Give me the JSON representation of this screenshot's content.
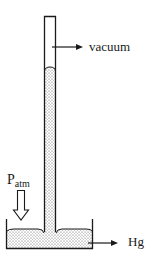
{
  "diagram": {
    "labels": {
      "vacuum": "vacuum",
      "mercury": "Hg",
      "pressure_main": "P",
      "pressure_sub": "atm"
    },
    "colors": {
      "stroke": "#1a1a1a",
      "fill": "#ffffff",
      "stipple": "#555555"
    }
  }
}
